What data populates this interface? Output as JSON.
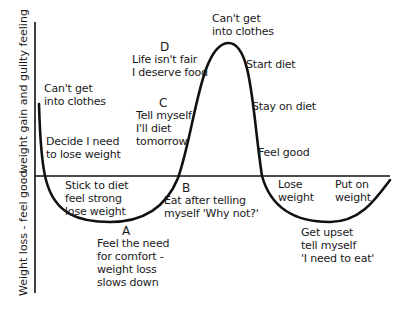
{
  "diagram": {
    "type": "cycle-curve",
    "axis": {
      "upper_label": "weight gain and guilty feeling",
      "lower_label": "Weight loss - feel good"
    },
    "points": {
      "A": {
        "letter": "A",
        "text": "Feel the need\nfor comfort -\nweight loss\nslows down"
      },
      "B": {
        "letter": "B",
        "text": "Eat after telling\nmyself 'Why not?'"
      },
      "C": {
        "letter": "C",
        "text": "Tell myself\nI'll diet\ntomorrow"
      },
      "D": {
        "letter": "D",
        "text": "Life isn't fair\nI deserve food"
      }
    },
    "labels": {
      "cant_get_left": "Can't get\ninto clothes",
      "decide": "Decide I need\nto lose weight",
      "stick": "Stick to diet\nfeel strong\nlose weight",
      "cant_get_peak": "Can't get\ninto clothes",
      "start_diet": "Start diet",
      "stay_on_diet": "Stay on diet",
      "feel_good": "Feel good",
      "lose_weight": "Lose\nweight",
      "put_on_weight": "Put on\nweight",
      "get_upset": "Get upset\ntell myself\n'I need to eat'"
    },
    "colors": {
      "line": "#111111",
      "text": "#1a1a1a",
      "background": "#ffffff"
    }
  }
}
